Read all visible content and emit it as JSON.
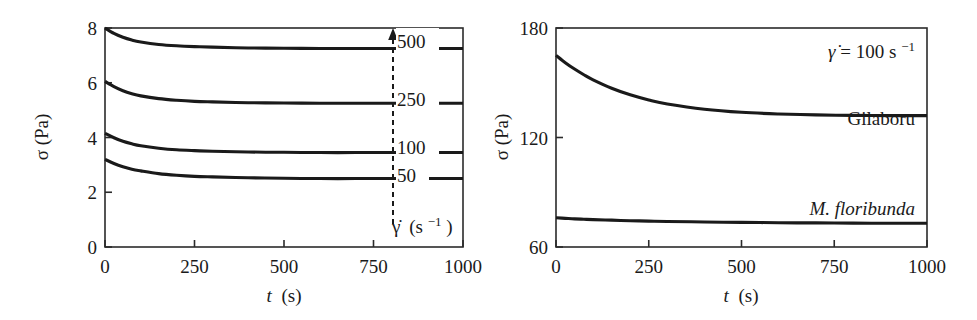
{
  "figure": {
    "background": "#ffffff",
    "stroke_color": "#1a1a1a"
  },
  "panels": {
    "left": {
      "name": "shear-stress-vs-time-shear-rates",
      "x_axis": {
        "label_var": "t",
        "label_unit": "(s)",
        "ticks": [
          "0",
          "250",
          "500",
          "750",
          "1000"
        ],
        "min": 0,
        "max": 1000
      },
      "y_axis": {
        "label": "σ (Pa)",
        "ticks": [
          "0",
          "2",
          "4",
          "6",
          "8"
        ],
        "min": 0,
        "max": 8
      },
      "legend": {
        "items": [
          "500",
          "250",
          "100",
          "50"
        ],
        "axis_label_var": "γ̇",
        "axis_label_unit": "(s",
        "axis_label_exp": "−1",
        "axis_label_close": ")",
        "arrow_direction": "up",
        "arrow_style": "dashed"
      }
    },
    "right": {
      "name": "shear-stress-vs-time-samples",
      "x_axis": {
        "label_var": "t",
        "label_unit": "(s)",
        "ticks": [
          "0",
          "250",
          "500",
          "750",
          "1000"
        ],
        "min": 0,
        "max": 1000
      },
      "y_axis": {
        "label": "σ (Pa)",
        "ticks": [
          "60",
          "120",
          "180"
        ],
        "min": 60,
        "max": 180
      },
      "annotation": {
        "var": "γ̇",
        "eq": " = 100 s",
        "exp": "−1"
      },
      "curve_labels": {
        "gilaboru": "Gilaboru",
        "floribunda": "M. floribunda"
      }
    }
  },
  "chart_data": [
    {
      "type": "line",
      "panel": "left",
      "title": "",
      "xlabel": "t (s)",
      "ylabel": "σ (Pa)",
      "xlim": [
        0,
        1000
      ],
      "ylim": [
        0,
        8
      ],
      "xticks": [
        0,
        250,
        500,
        750,
        1000
      ],
      "yticks": [
        0,
        2,
        4,
        6,
        8
      ],
      "grid": false,
      "legend_position": "inside-right",
      "legend_title": "γ̇ (s⁻¹)",
      "x": [
        0,
        25,
        50,
        75,
        100,
        150,
        200,
        250,
        300,
        400,
        500,
        600,
        700,
        800,
        900,
        1000
      ],
      "series": [
        {
          "name": "500",
          "shear_rate": 500,
          "values": [
            8.0,
            7.8,
            7.66,
            7.56,
            7.49,
            7.4,
            7.35,
            7.32,
            7.3,
            7.27,
            7.26,
            7.25,
            7.25,
            7.25,
            7.25,
            7.25
          ]
        },
        {
          "name": "250",
          "shear_rate": 250,
          "values": [
            6.05,
            5.86,
            5.71,
            5.6,
            5.52,
            5.42,
            5.36,
            5.32,
            5.3,
            5.27,
            5.26,
            5.25,
            5.25,
            5.25,
            5.25,
            5.25
          ]
        },
        {
          "name": "100",
          "shear_rate": 100,
          "values": [
            4.15,
            3.99,
            3.86,
            3.77,
            3.7,
            3.61,
            3.55,
            3.52,
            3.5,
            3.47,
            3.46,
            3.45,
            3.45,
            3.45,
            3.45,
            3.45
          ]
        },
        {
          "name": "50",
          "shear_rate": 50,
          "values": [
            3.2,
            3.05,
            2.93,
            2.84,
            2.78,
            2.68,
            2.62,
            2.58,
            2.56,
            2.53,
            2.51,
            2.5,
            2.5,
            2.5,
            2.5,
            2.5
          ]
        }
      ]
    },
    {
      "type": "line",
      "panel": "right",
      "title": "",
      "xlabel": "t (s)",
      "ylabel": "σ (Pa)",
      "xlim": [
        0,
        1000
      ],
      "ylim": [
        60,
        180
      ],
      "xticks": [
        0,
        250,
        500,
        750,
        1000
      ],
      "yticks": [
        60,
        120,
        180
      ],
      "grid": false,
      "annotation": "γ̇ = 100 s⁻¹",
      "x": [
        0,
        25,
        50,
        75,
        100,
        150,
        200,
        250,
        300,
        400,
        500,
        600,
        700,
        800,
        900,
        1000
      ],
      "series": [
        {
          "name": "Gilaboru",
          "values": [
            165.0,
            161.0,
            157.5,
            154.4,
            151.6,
            147.0,
            143.4,
            140.6,
            138.4,
            135.5,
            133.8,
            132.9,
            132.4,
            132.1,
            132.0,
            132.0
          ]
        },
        {
          "name": "M. floribunda",
          "values": [
            76.0,
            75.7,
            75.4,
            75.2,
            75.0,
            74.7,
            74.4,
            74.2,
            74.0,
            73.7,
            73.5,
            73.3,
            73.2,
            73.1,
            73.0,
            73.0
          ]
        }
      ]
    }
  ]
}
